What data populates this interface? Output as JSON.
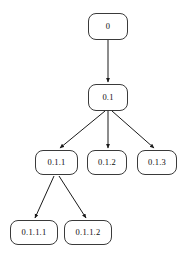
{
  "diagram": {
    "type": "tree",
    "background_color": "#ffffff",
    "node_border_color": "#3a3a3a",
    "node_fill_color": "#ffffff",
    "edge_color": "#1a1a1a",
    "text_color": "#0d0d0d",
    "nodes": [
      {
        "id": "n0",
        "label": "0",
        "level": 1,
        "x": 88,
        "y": 13,
        "w": 40,
        "h": 27,
        "font_size": 8.5
      },
      {
        "id": "n01",
        "label": "0.1",
        "level": 2,
        "x": 88,
        "y": 84,
        "w": 40,
        "h": 27,
        "font_size": 8.5
      },
      {
        "id": "n011",
        "label": "0.1.1",
        "level": 3,
        "x": 35,
        "y": 150,
        "w": 43,
        "h": 25,
        "font_size": 8.5
      },
      {
        "id": "n012",
        "label": "0.1.2",
        "level": 3,
        "x": 87,
        "y": 150,
        "w": 40,
        "h": 25,
        "font_size": 8.5
      },
      {
        "id": "n013",
        "label": "0.1.3",
        "level": 3,
        "x": 137,
        "y": 150,
        "w": 40,
        "h": 25,
        "font_size": 8.5
      },
      {
        "id": "n0111",
        "label": "0.1.1.1",
        "level": 4,
        "x": 10,
        "y": 220,
        "w": 48,
        "h": 25,
        "font_size": 8.5
      },
      {
        "id": "n0112",
        "label": "0.1.1.2",
        "level": 4,
        "x": 64,
        "y": 220,
        "w": 48,
        "h": 25,
        "font_size": 8.5
      }
    ],
    "edges": [
      {
        "id": "e-0-01",
        "from": "0",
        "to": "0.1",
        "x1": 108,
        "y1": 40,
        "x2": 108,
        "y2": 82
      },
      {
        "id": "e-01-011",
        "from": "0.1",
        "to": "0.1.1",
        "x1": 105,
        "y1": 111,
        "x2": 60,
        "y2": 148
      },
      {
        "id": "e-01-012",
        "from": "0.1",
        "to": "0.1.2",
        "x1": 108,
        "y1": 111,
        "x2": 108,
        "y2": 148
      },
      {
        "id": "e-01-013",
        "from": "0.1",
        "to": "0.1.3",
        "x1": 112,
        "y1": 111,
        "x2": 154,
        "y2": 148
      },
      {
        "id": "e-011-0111",
        "from": "0.1.1",
        "to": "0.1.1.1",
        "x1": 54,
        "y1": 176,
        "x2": 35,
        "y2": 218
      },
      {
        "id": "e-011-0112",
        "from": "0.1.1",
        "to": "0.1.1.2",
        "x1": 59,
        "y1": 176,
        "x2": 86,
        "y2": 218
      }
    ]
  }
}
